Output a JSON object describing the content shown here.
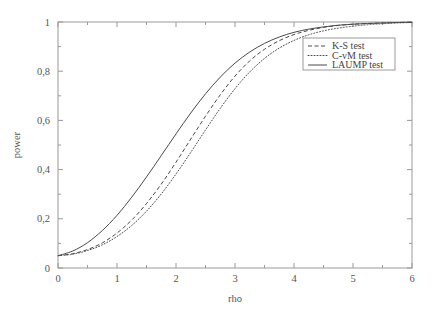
{
  "chart_data": {
    "type": "line",
    "title": "",
    "xlabel": "rho",
    "ylabel": "power",
    "xlim": [
      0,
      6
    ],
    "ylim": [
      0,
      1
    ],
    "grid": false,
    "legend_position": "top-right",
    "x_tick_labels": [
      "0",
      "1",
      "2",
      "3",
      "4",
      "5",
      "6"
    ],
    "x_tick_values": [
      0,
      1,
      2,
      3,
      4,
      5,
      6
    ],
    "x_minor_tick_values": [
      0.5,
      1.5,
      2.5,
      3.5,
      4.5,
      5.5
    ],
    "y_tick_labels": [
      "0",
      "0,2",
      "0,4",
      "0,6",
      "0,8",
      "1"
    ],
    "y_tick_values": [
      0,
      0.2,
      0.4,
      0.6,
      0.8,
      1
    ],
    "y_minor_tick_values": [
      0.1,
      0.3,
      0.5,
      0.7,
      0.9
    ],
    "x": [
      0,
      0.25,
      0.5,
      0.75,
      1,
      1.25,
      1.5,
      1.75,
      2,
      2.25,
      2.5,
      2.75,
      3,
      3.25,
      3.5,
      3.75,
      4,
      4.25,
      4.5,
      4.75,
      5,
      5.25,
      5.5,
      5.75,
      6
    ],
    "series": [
      {
        "name": "K-S test",
        "style": "dashed",
        "color": "#4a4a4a",
        "values": [
          0.05,
          0.058,
          0.075,
          0.102,
          0.142,
          0.195,
          0.262,
          0.341,
          0.43,
          0.524,
          0.617,
          0.704,
          0.78,
          0.842,
          0.889,
          0.924,
          0.949,
          0.966,
          0.978,
          0.986,
          0.991,
          0.994,
          0.996,
          0.998,
          0.999
        ]
      },
      {
        "name": "C-vM test",
        "style": "dotted",
        "color": "#4a4a4a",
        "values": [
          0.05,
          0.056,
          0.071,
          0.094,
          0.128,
          0.173,
          0.231,
          0.301,
          0.382,
          0.47,
          0.561,
          0.649,
          0.729,
          0.797,
          0.852,
          0.894,
          0.925,
          0.948,
          0.964,
          0.975,
          0.983,
          0.989,
          0.993,
          0.996,
          0.998
        ]
      },
      {
        "name": "LAUMP test",
        "style": "solid",
        "color": "#4a4a4a",
        "values": [
          0.05,
          0.069,
          0.103,
          0.152,
          0.214,
          0.288,
          0.37,
          0.457,
          0.545,
          0.63,
          0.708,
          0.776,
          0.833,
          0.878,
          0.913,
          0.939,
          0.958,
          0.971,
          0.98,
          0.987,
          0.991,
          0.994,
          0.996,
          0.998,
          0.999
        ]
      }
    ]
  },
  "legend": {
    "entries": [
      {
        "label": "K-S test"
      },
      {
        "label": "C-vM test"
      },
      {
        "label": "LAUMP test"
      }
    ]
  }
}
